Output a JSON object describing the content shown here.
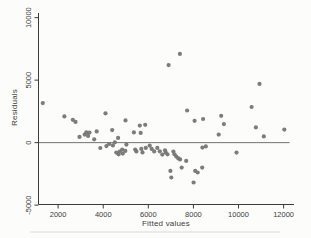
{
  "chart_data": {
    "type": "scatter",
    "title": "",
    "xlabel": "Fitted values",
    "ylabel": "Residuals",
    "xlim": [
      1130,
      12460
    ],
    "ylim": [
      -4950,
      10370
    ],
    "xticks": [
      2000,
      4000,
      6000,
      8000,
      10000,
      12000
    ],
    "yticks": [
      -5000,
      0,
      5000,
      10000
    ],
    "refline_y": 0,
    "grid": false,
    "legend": "none",
    "marker": "filled-circle",
    "marker_radius": 2.1,
    "colors": {
      "point": "#757575",
      "axis": "#3c3c3c",
      "refline": "#4f4f4f",
      "text": "#3c3c3c",
      "background": "#fcfcfa"
    },
    "series": [
      {
        "name": "residuals",
        "points": [
          [
            1320,
            3160
          ],
          [
            2280,
            2100
          ],
          [
            2650,
            1830
          ],
          [
            2770,
            1660
          ],
          [
            2950,
            460
          ],
          [
            3180,
            640
          ],
          [
            3250,
            820
          ],
          [
            3330,
            540
          ],
          [
            3390,
            800
          ],
          [
            3600,
            270
          ],
          [
            3710,
            900
          ],
          [
            3870,
            -430
          ],
          [
            4100,
            2350
          ],
          [
            4140,
            -280
          ],
          [
            4260,
            -110
          ],
          [
            4400,
            1000
          ],
          [
            4430,
            -220
          ],
          [
            4520,
            30
          ],
          [
            4580,
            -800
          ],
          [
            4660,
            380
          ],
          [
            4680,
            -930
          ],
          [
            4730,
            -710
          ],
          [
            4840,
            -560
          ],
          [
            4870,
            -880
          ],
          [
            4980,
            -660
          ],
          [
            4990,
            1780
          ],
          [
            5030,
            -160
          ],
          [
            5360,
            820
          ],
          [
            5420,
            -560
          ],
          [
            5470,
            -700
          ],
          [
            5620,
            1360
          ],
          [
            5660,
            780
          ],
          [
            5690,
            -500
          ],
          [
            5740,
            -780
          ],
          [
            5860,
            1430
          ],
          [
            5890,
            -420
          ],
          [
            6060,
            -240
          ],
          [
            6150,
            -500
          ],
          [
            6260,
            -700
          ],
          [
            6400,
            -420
          ],
          [
            6510,
            -690
          ],
          [
            6620,
            -960
          ],
          [
            6740,
            -610
          ],
          [
            6770,
            -780
          ],
          [
            6850,
            -930
          ],
          [
            6900,
            6200
          ],
          [
            6980,
            -2260
          ],
          [
            7020,
            -2790
          ],
          [
            7110,
            -720
          ],
          [
            7160,
            -930
          ],
          [
            7240,
            -1120
          ],
          [
            7330,
            -1260
          ],
          [
            7400,
            7100
          ],
          [
            7410,
            -1340
          ],
          [
            7480,
            -2000
          ],
          [
            7680,
            -1460
          ],
          [
            7720,
            2570
          ],
          [
            8010,
            -3190
          ],
          [
            8050,
            1750
          ],
          [
            8080,
            -2260
          ],
          [
            8190,
            -2390
          ],
          [
            8390,
            -2000
          ],
          [
            8400,
            -400
          ],
          [
            8430,
            1890
          ],
          [
            8550,
            -300
          ],
          [
            9120,
            640
          ],
          [
            9230,
            2150
          ],
          [
            9350,
            1480
          ],
          [
            9910,
            -800
          ],
          [
            10580,
            2850
          ],
          [
            10770,
            1220
          ],
          [
            10930,
            4700
          ],
          [
            11120,
            500
          ],
          [
            12030,
            1040
          ]
        ]
      }
    ]
  }
}
